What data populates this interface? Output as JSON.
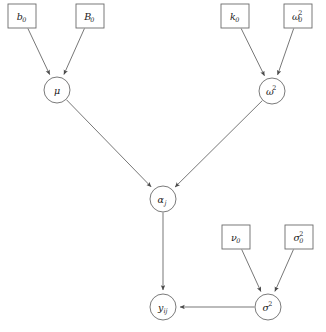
{
  "diagram": {
    "type": "directed-acyclic-graph",
    "title": "",
    "background_color": "#ffffff",
    "stroke_color": "#6b6b6b",
    "text_color": "#1a1a1a",
    "nodes": [
      {
        "id": "b0",
        "shape": "rectangle",
        "base": "b",
        "sub": "0",
        "sup": "",
        "x": 22,
        "y": 16
      },
      {
        "id": "B0",
        "shape": "rectangle",
        "base": "B",
        "sub": "0",
        "sup": "",
        "x": 90,
        "y": 16
      },
      {
        "id": "k0",
        "shape": "rectangle",
        "base": "k",
        "sub": "0",
        "sup": "",
        "x": 235,
        "y": 16
      },
      {
        "id": "omega02",
        "shape": "rectangle",
        "base": "ω",
        "sub": "0",
        "sup": "2",
        "x": 298,
        "y": 16
      },
      {
        "id": "mu",
        "shape": "circle",
        "base": "μ",
        "sub": "",
        "sup": "",
        "x": 57,
        "y": 90
      },
      {
        "id": "omega2",
        "shape": "circle",
        "base": "ω",
        "sub": "",
        "sup": "2",
        "x": 272,
        "y": 91
      },
      {
        "id": "alphaj",
        "shape": "circle",
        "base": "α",
        "sub": "j",
        "sup": "",
        "x": 163,
        "y": 199
      },
      {
        "id": "nu0",
        "shape": "rectangle",
        "base": "ν",
        "sub": "0",
        "sup": "",
        "x": 236,
        "y": 237
      },
      {
        "id": "sigma02",
        "shape": "rectangle",
        "base": "σ",
        "sub": "0",
        "sup": "2",
        "x": 299,
        "y": 237
      },
      {
        "id": "yij",
        "shape": "circle",
        "base": "y",
        "sub": "ij",
        "sup": "",
        "x": 163,
        "y": 307
      },
      {
        "id": "sigma2",
        "shape": "circle",
        "base": "σ",
        "sub": "",
        "sup": "2",
        "x": 268,
        "y": 307
      }
    ],
    "edges": [
      {
        "from": "b0",
        "to": "mu"
      },
      {
        "from": "B0",
        "to": "mu"
      },
      {
        "from": "k0",
        "to": "omega2"
      },
      {
        "from": "omega02",
        "to": "omega2"
      },
      {
        "from": "mu",
        "to": "alphaj"
      },
      {
        "from": "omega2",
        "to": "alphaj"
      },
      {
        "from": "alphaj",
        "to": "yij"
      },
      {
        "from": "nu0",
        "to": "sigma2"
      },
      {
        "from": "sigma02",
        "to": "sigma2"
      },
      {
        "from": "sigma2",
        "to": "yij"
      }
    ]
  }
}
